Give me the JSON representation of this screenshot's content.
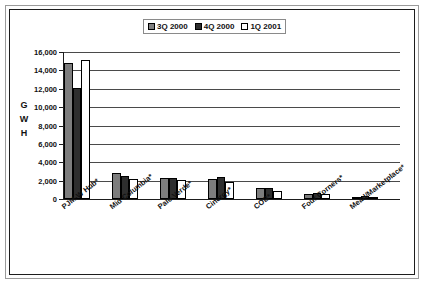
{
  "chart_data": {
    "type": "bar",
    "title": "",
    "xlabel": "",
    "ylabel": "GWH",
    "ylim": [
      0,
      16000
    ],
    "ytick_values": [
      16000,
      14000,
      12000,
      10000,
      8000,
      6000,
      4000,
      2000,
      0
    ],
    "ytick_labels": [
      "16,000",
      "14,000",
      "12,000",
      "10,000",
      "8,000",
      "6,000",
      "4,000",
      "2,000",
      "0"
    ],
    "grid": true,
    "legend_position": "top-center",
    "categories": [
      "PJM-W Hub*",
      "Mid Columbia*",
      "Palo Verde*",
      "Cinergy*",
      "COB*",
      "Four Corners*",
      "Mead/Marketplace*"
    ],
    "series": [
      {
        "name": "3Q 2000",
        "color": "#7d7d7d",
        "values": [
          14800,
          2800,
          2250,
          2150,
          1150,
          600,
          250
        ]
      },
      {
        "name": "4Q 2000",
        "color": "#2e2e2e",
        "values": [
          12050,
          2500,
          2300,
          2400,
          1200,
          700,
          300
        ]
      },
      {
        "name": "1Q 2001",
        "color": "#ffffff",
        "values": [
          15150,
          2200,
          2100,
          1900,
          850,
          500,
          200
        ]
      }
    ]
  },
  "axis": {
    "ylabel_chars": [
      "G",
      "W",
      "H"
    ]
  }
}
